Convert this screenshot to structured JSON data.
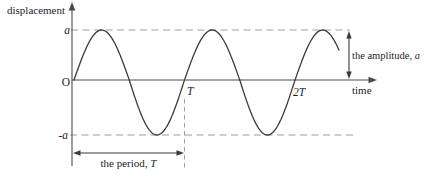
{
  "figure": {
    "y_axis_label": "displacement",
    "x_axis_label": "time",
    "origin_label": "O",
    "y_tick_positive": "a",
    "y_tick_negative": "-a",
    "x_tick_period": "T",
    "x_tick_double_period": "2T",
    "amplitude_annotation_text": "the amplitude,",
    "amplitude_annotation_symbol": "a",
    "period_annotation_text": "the period,",
    "period_annotation_symbol": "T",
    "curve": {
      "type": "sine",
      "starts_at_origin": true,
      "peak_value": "a",
      "trough_value": "-a",
      "period": "T",
      "cycles_shown": 2.4
    },
    "colors": {
      "background": "#ffffff",
      "curve": "#3a3a3a",
      "axis": "#4a4a4a",
      "dashed_guides": "#9e9e9e",
      "text": "#1e1e1e"
    }
  }
}
